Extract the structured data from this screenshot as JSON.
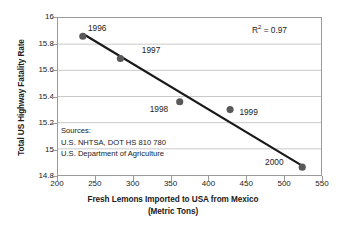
{
  "chart_data": {
    "type": "scatter",
    "title": "",
    "xlabel": "Fresh Lemons Imported to USA from Mexico",
    "xlabel_line2": "(Metric Tons)",
    "ylabel": "Total US Highway Fatality Rate",
    "xlim": [
      200,
      550
    ],
    "ylim": [
      14.8,
      16
    ],
    "xticks": [
      200,
      250,
      300,
      350,
      400,
      450,
      500,
      550
    ],
    "yticks": [
      16,
      15.8,
      15.6,
      15.4,
      15.2,
      15,
      14.8
    ],
    "ytick_labels": [
      "16",
      "15.8",
      "15.6",
      "15.4",
      "15.2",
      "15",
      "14.8"
    ],
    "xtick_labels": [
      "200",
      "250",
      "300",
      "350",
      "400",
      "450",
      "500",
      "550"
    ],
    "grid": "horizontal",
    "legend": "none",
    "marker_color": "#595959",
    "trendline_color": "#1a1a1a",
    "points": [
      {
        "label": "1996",
        "x": 233,
        "y": 15.86,
        "label_dx": 6,
        "label_dy": -12
      },
      {
        "label": "1997",
        "x": 283,
        "y": 15.69,
        "label_dx": 22,
        "label_dy": -12
      },
      {
        "label": "1998",
        "x": 362,
        "y": 15.36,
        "label_dx": -30,
        "label_dy": 3
      },
      {
        "label": "1999",
        "x": 429,
        "y": 15.3,
        "label_dx": 9,
        "label_dy": -2
      },
      {
        "label": "2000",
        "x": 525,
        "y": 14.86,
        "label_dx": -38,
        "label_dy": -10
      }
    ],
    "trendline": {
      "x0": 233,
      "y0": 15.88,
      "x1": 528,
      "y1": 14.86
    },
    "annotations": {
      "r_squared_prefix": "R",
      "r_squared_sup": "2",
      "r_squared_value": " = 0.97"
    },
    "sources": {
      "heading": "Sources:",
      "line1": "U.S. NHTSA, DOT HS 810 780",
      "line2": "U.S. Department of Agriculture"
    }
  }
}
